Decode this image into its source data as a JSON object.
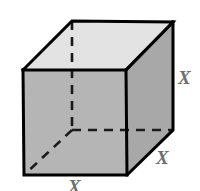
{
  "figure": {
    "shape_name": "cube",
    "projection": "oblique",
    "background_color": "#ffffff",
    "outline_color": "#000000",
    "outline_width": 3,
    "hidden_edge_style": "dashed",
    "faces": {
      "top": {
        "name": "top-face",
        "fill": "#e3e3e3",
        "points": "23,70 72,21 173,22 126,70"
      },
      "front": {
        "name": "front-face",
        "fill": "#b5b5b5",
        "points": "23,70 126,70 127,175 24,175"
      },
      "right": {
        "name": "right-face",
        "fill": "#a8a8a8",
        "points": "126,70 173,22 173,130 127,175"
      }
    },
    "vertices": {
      "front_top_left": "23,70",
      "front_top_right": "126,70",
      "front_bottom_right": "127,175",
      "front_bottom_left": "24,175",
      "back_top_left": "72,21",
      "back_top_right": "173,22",
      "back_bottom_right": "173,130",
      "back_bottom_hidden": "72,130"
    },
    "visible_edges": [
      "23,70 72,21",
      "72,21 173,22",
      "173,22 126,70",
      "23,70 126,70",
      "173,22 173,130",
      "126,70 173,22",
      "23,70 24,175",
      "126,70 127,175",
      "24,175 127,175",
      "127,175 173,130"
    ],
    "hidden_edges": [
      "72,21 72,130",
      "72,130 173,130",
      "72,130 24,175"
    ]
  },
  "labels": {
    "right_edge": {
      "text": "X",
      "color": "#6e6e6e",
      "meaning": "vertical-edge-length"
    },
    "depth_edge": {
      "text": "X",
      "color": "#6e6e6e",
      "meaning": "depth-edge-length"
    },
    "bottom_edge": {
      "text": "X",
      "color": "#6e6e6e",
      "meaning": "bottom-edge-length"
    }
  }
}
